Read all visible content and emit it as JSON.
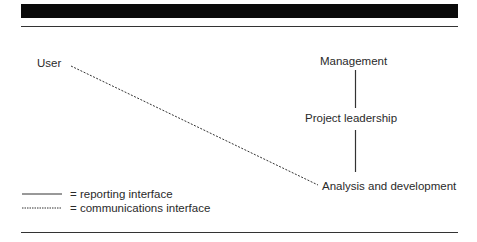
{
  "diagram": {
    "nodes": {
      "user": "User",
      "management": "Management",
      "project_leadership": "Project leadership",
      "analysis": "Analysis and development"
    },
    "edges": [
      {
        "from": "Management",
        "to": "Project leadership",
        "type": "reporting"
      },
      {
        "from": "Project leadership",
        "to": "Analysis and development",
        "type": "reporting"
      },
      {
        "from": "User",
        "to": "Analysis and development",
        "type": "communications"
      }
    ],
    "legend": {
      "reporting": "= reporting interface",
      "communications": "= communications interface"
    }
  },
  "colors": {
    "header_bar": "#0a0a0a",
    "line": "#333333",
    "text": "#2a2a2a"
  }
}
